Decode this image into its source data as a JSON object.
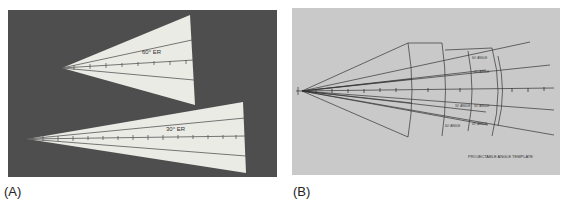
{
  "figure": {
    "panels": [
      {
        "id": "A",
        "label": "(A)",
        "background": "#4e4e4e",
        "description": "Two paper triangular gauges on dark background",
        "gauges": [
          {
            "caption": "60° ER",
            "tick_count": 8
          },
          {
            "caption": "30° ER",
            "tick_count": 14
          }
        ]
      },
      {
        "id": "B",
        "label": "(B)",
        "background": "#c9c9c9",
        "description": "Line drawing of a fan template with radial rays and arcs",
        "ray_labels": [
          "60° ANGLE",
          "45° ANGLE",
          "30° ANGLE",
          "30° ANGLE",
          "45° ANGLE",
          "60° ANGLE"
        ],
        "footer_caption": "PROJECTABLE ANGLE TEMPLATE"
      }
    ]
  }
}
